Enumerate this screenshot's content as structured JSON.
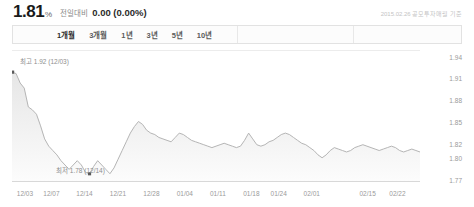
{
  "header": {
    "price": "1.81",
    "price_unit": "%",
    "compare_label": "전일대비",
    "compare_value": "0.00 (0.00%)",
    "timestamp": "2015.02.26 공모투자매월 기준"
  },
  "tabs": [
    {
      "label": "1개월",
      "active": true
    },
    {
      "label": "3개월",
      "active": false
    },
    {
      "label": "1년",
      "active": false
    },
    {
      "label": "3년",
      "active": false
    },
    {
      "label": "5년",
      "active": false
    },
    {
      "label": "10년",
      "active": false
    }
  ],
  "annotations": {
    "high": "최고 1.92 (12/03)",
    "low": "최저 1.78 (12/14)"
  },
  "colors": {
    "line": "#b5b5b5",
    "area_top": "#e9e9e9",
    "area_bottom": "#fbfbfb",
    "grid": "#ececec",
    "axis_text": "#9a9a9a",
    "marker": "#5a5a5a"
  },
  "chart_data": {
    "type": "line",
    "title": "",
    "xlabel": "",
    "ylabel": "",
    "grid": false,
    "legend": "none",
    "ylim": [
      1.77,
      1.945
    ],
    "yticks": [
      1.94,
      1.91,
      1.88,
      1.85,
      1.82,
      1.8,
      1.77
    ],
    "ytick_labels": [
      "1.94",
      "1.91",
      "1.88",
      "1.85",
      "1.82",
      "1.80",
      "1.77"
    ],
    "xticks": [
      "12/03",
      "12/07",
      "12/14",
      "12/21",
      "12/28",
      "01/04",
      "01/11",
      "01/18",
      "01/24",
      "02/01",
      "02/15",
      "02/22"
    ],
    "xtick_positions": [
      0.017,
      0.082,
      0.163,
      0.245,
      0.327,
      0.409,
      0.49,
      0.572,
      0.639,
      0.72,
      0.857,
      0.93
    ],
    "high_point": {
      "label": "최고",
      "value": 1.92,
      "date": "12/03",
      "x_frac": 0.017
    },
    "low_point": {
      "label": "최저",
      "value": 1.78,
      "date": "12/14",
      "x_frac": 0.163
    },
    "series": [
      {
        "name": "기준가",
        "values": [
          1.92,
          1.918,
          1.905,
          1.898,
          1.872,
          1.868,
          1.862,
          1.846,
          1.828,
          1.818,
          1.812,
          1.806,
          1.798,
          1.792,
          1.786,
          1.792,
          1.798,
          1.792,
          1.782,
          1.78,
          1.79,
          1.798,
          1.792,
          1.786,
          1.78,
          1.788,
          1.8,
          1.812,
          1.824,
          1.836,
          1.845,
          1.852,
          1.848,
          1.84,
          1.836,
          1.834,
          1.83,
          1.828,
          1.826,
          1.824,
          1.83,
          1.836,
          1.834,
          1.83,
          1.826,
          1.824,
          1.822,
          1.82,
          1.818,
          1.816,
          1.818,
          1.82,
          1.822,
          1.82,
          1.818,
          1.816,
          1.818,
          1.826,
          1.836,
          1.828,
          1.82,
          1.818,
          1.82,
          1.824,
          1.826,
          1.83,
          1.834,
          1.836,
          1.834,
          1.83,
          1.826,
          1.822,
          1.82,
          1.816,
          1.812,
          1.806,
          1.802,
          1.806,
          1.812,
          1.816,
          1.814,
          1.812,
          1.81,
          1.812,
          1.816,
          1.818,
          1.82,
          1.818,
          1.816,
          1.814,
          1.812,
          1.814,
          1.816,
          1.818,
          1.816,
          1.812,
          1.81,
          1.812,
          1.814,
          1.812,
          1.81
        ]
      }
    ]
  }
}
